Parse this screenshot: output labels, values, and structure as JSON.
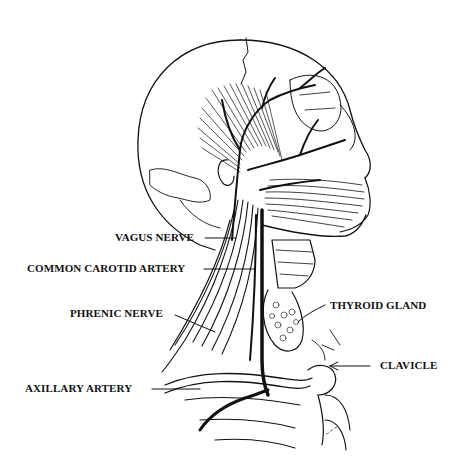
{
  "figure": {
    "colors": {
      "ink": "#111111",
      "background": "#ffffff"
    }
  },
  "labels": [
    {
      "id": "vagus-nerve",
      "text": "VAGUS NERVE",
      "side": "left"
    },
    {
      "id": "common-carotid-artery",
      "text": "COMMON CAROTID ARTERY",
      "side": "left"
    },
    {
      "id": "phrenic-nerve",
      "text": "PHRENIC NERVE",
      "side": "left"
    },
    {
      "id": "axillary-artery",
      "text": "AXILLARY ARTERY",
      "side": "left"
    },
    {
      "id": "thyroid-gland",
      "text": "THYROID GLAND",
      "side": "right"
    },
    {
      "id": "clavicle",
      "text": "CLAVICLE",
      "side": "right"
    }
  ]
}
